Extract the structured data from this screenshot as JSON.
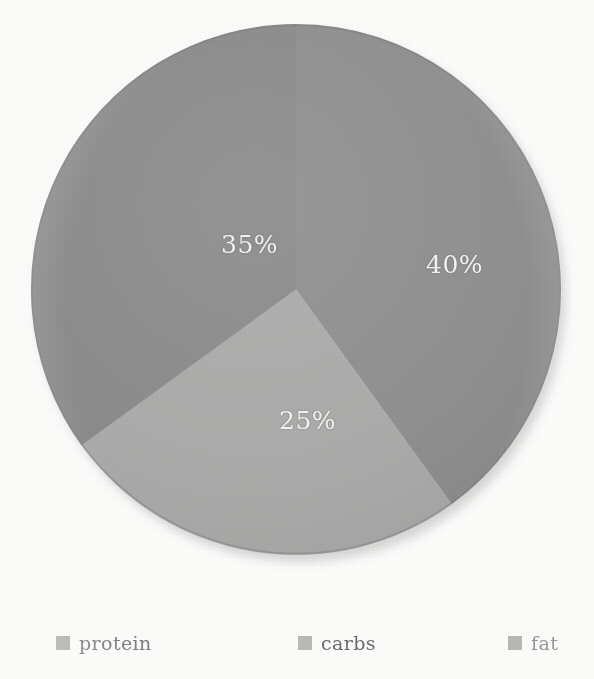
{
  "chart_data": {
    "type": "pie",
    "title": "",
    "subtitle": "",
    "categories": [
      "protein",
      "carbs",
      "fat"
    ],
    "values": [
      40,
      25,
      35
    ],
    "value_labels": [
      "40%",
      "25%",
      "35%"
    ],
    "unit": "%",
    "total": 100,
    "start_angle_deg": 0,
    "direction": "clockwise",
    "legend_position": "bottom",
    "grid": false,
    "slices": [
      {
        "name": "protein",
        "value": 40,
        "label": "40%",
        "color": "#8e8e8e",
        "start_angle_deg": 0,
        "end_angle_deg": 144
      },
      {
        "name": "carbs",
        "value": 25,
        "label": "25%",
        "color": "#aaaaa9",
        "start_angle_deg": 144,
        "end_angle_deg": 234
      },
      {
        "name": "fat",
        "value": 35,
        "label": "35%",
        "color": "#8a8a8a",
        "start_angle_deg": 234,
        "end_angle_deg": 360
      }
    ],
    "colors": {
      "protein": "#8e8e8e",
      "carbs": "#aaaaa9",
      "fat": "#8a8a8a",
      "label_text": "#f4f4f2",
      "legend_text": "#575757",
      "background": "#fdfdfc"
    }
  },
  "legend": {
    "items": [
      {
        "label": "protein",
        "swatch_color": "#9a9a99",
        "swatch_icon": "legend-swatch-icon"
      },
      {
        "label": "carbs",
        "swatch_color": "#b2b2b1",
        "swatch_icon": "legend-swatch-icon"
      },
      {
        "label": "fat",
        "swatch_color": "#969695",
        "swatch_icon": "legend-swatch-icon"
      }
    ]
  }
}
